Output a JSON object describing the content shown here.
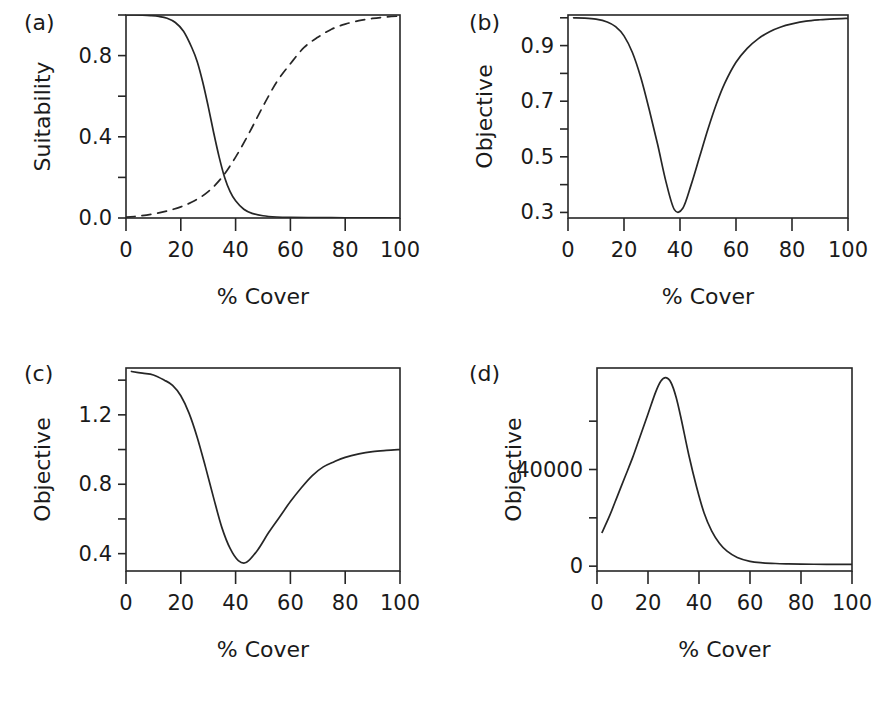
{
  "figure": {
    "width": 891,
    "height": 703,
    "background": "#ffffff",
    "ink_color": "#262626"
  },
  "chart_data": [
    {
      "type": "line",
      "panel_label": "(a)",
      "title": "",
      "xlabel": "% Cover",
      "ylabel": "Suitability",
      "xlim": [
        0,
        100
      ],
      "ylim": [
        0.0,
        1.0
      ],
      "xticks": [
        0,
        20,
        40,
        60,
        80,
        100
      ],
      "xticklabels": [
        "0",
        "20",
        "40",
        "60",
        "80",
        "100"
      ],
      "yticks": [
        0.0,
        0.2,
        0.4,
        0.6,
        0.8,
        1.0
      ],
      "yticklabels": [
        "0.0",
        "",
        "0.4",
        "",
        "0.8",
        ""
      ],
      "grid": false,
      "legend": "none",
      "series": [
        {
          "name": "declining suitability",
          "style": "solid",
          "x": [
            0,
            3,
            6,
            9,
            12,
            15,
            18,
            21,
            24,
            26,
            28,
            30,
            32,
            34,
            36,
            38,
            40,
            43,
            46,
            50,
            55,
            60,
            70,
            80,
            90,
            100
          ],
          "values": [
            1.0,
            1.0,
            0.999,
            0.997,
            0.993,
            0.984,
            0.963,
            0.92,
            0.84,
            0.77,
            0.67,
            0.55,
            0.42,
            0.3,
            0.2,
            0.13,
            0.085,
            0.043,
            0.023,
            0.011,
            0.005,
            0.003,
            0.002,
            0.001,
            0.001,
            0.0
          ]
        },
        {
          "name": "increasing suitability",
          "style": "dashed",
          "x": [
            0,
            5,
            10,
            15,
            20,
            25,
            30,
            35,
            40,
            45,
            50,
            55,
            60,
            65,
            70,
            75,
            80,
            85,
            90,
            95,
            100
          ],
          "values": [
            0.004,
            0.01,
            0.02,
            0.035,
            0.055,
            0.085,
            0.13,
            0.2,
            0.3,
            0.42,
            0.55,
            0.67,
            0.76,
            0.84,
            0.89,
            0.93,
            0.955,
            0.972,
            0.983,
            0.99,
            0.995
          ]
        }
      ]
    },
    {
      "type": "line",
      "panel_label": "(b)",
      "title": "",
      "xlabel": "% Cover",
      "ylabel": "Objective",
      "xlim": [
        0,
        100
      ],
      "ylim": [
        0.28,
        1.01
      ],
      "xticks": [
        0,
        20,
        40,
        60,
        80,
        100
      ],
      "xticklabels": [
        "0",
        "20",
        "40",
        "60",
        "80",
        "100"
      ],
      "yticks": [
        0.3,
        0.4,
        0.5,
        0.6,
        0.7,
        0.8,
        0.9,
        1.0
      ],
      "yticklabels": [
        "0.3",
        "",
        "0.5",
        "",
        "0.7",
        "",
        "0.9",
        ""
      ],
      "grid": false,
      "legend": "none",
      "series": [
        {
          "name": "objective",
          "style": "solid",
          "x": [
            2,
            6,
            10,
            14,
            17,
            20,
            23,
            26,
            29,
            32,
            35,
            38,
            41,
            44,
            47,
            50,
            53,
            56,
            60,
            64,
            68,
            72,
            76,
            80,
            85,
            90,
            95,
            100
          ],
          "values": [
            1.0,
            0.999,
            0.995,
            0.985,
            0.968,
            0.935,
            0.875,
            0.785,
            0.67,
            0.545,
            0.41,
            0.31,
            0.315,
            0.4,
            0.5,
            0.6,
            0.69,
            0.765,
            0.84,
            0.89,
            0.925,
            0.95,
            0.967,
            0.978,
            0.988,
            0.993,
            0.996,
            0.998
          ]
        }
      ]
    },
    {
      "type": "line",
      "panel_label": "(c)",
      "title": "",
      "xlabel": "% Cover",
      "ylabel": "Objective",
      "xlim": [
        0,
        100
      ],
      "ylim": [
        0.3,
        1.47
      ],
      "xticks": [
        0,
        20,
        40,
        60,
        80,
        100
      ],
      "xticklabels": [
        "0",
        "20",
        "40",
        "60",
        "80",
        "100"
      ],
      "yticks": [
        0.4,
        0.6,
        0.8,
        1.0,
        1.2,
        1.4
      ],
      "yticklabels": [
        "0.4",
        "",
        "0.8",
        "",
        "1.2",
        ""
      ],
      "grid": false,
      "legend": "none",
      "series": [
        {
          "name": "objective",
          "style": "solid",
          "x": [
            2,
            6,
            10,
            14,
            17,
            20,
            23,
            26,
            29,
            32,
            35,
            38,
            41,
            44,
            48,
            52,
            56,
            60,
            64,
            68,
            72,
            76,
            80,
            85,
            90,
            95,
            100
          ],
          "values": [
            1.45,
            1.44,
            1.43,
            1.4,
            1.37,
            1.31,
            1.21,
            1.07,
            0.9,
            0.72,
            0.55,
            0.43,
            0.36,
            0.35,
            0.42,
            0.52,
            0.61,
            0.7,
            0.78,
            0.85,
            0.9,
            0.93,
            0.955,
            0.975,
            0.988,
            0.995,
            1.0
          ]
        }
      ]
    },
    {
      "type": "line",
      "panel_label": "(d)",
      "title": "",
      "xlabel": "% Cover",
      "ylabel": "Objective",
      "xlim": [
        0,
        100
      ],
      "ylim": [
        -2000,
        82000
      ],
      "xticks": [
        0,
        20,
        40,
        60,
        80,
        100
      ],
      "xticklabels": [
        "0",
        "20",
        "40",
        "60",
        "80",
        "100"
      ],
      "yticks": [
        0,
        20000,
        40000,
        60000
      ],
      "yticklabels": [
        "0",
        "",
        "40000",
        ""
      ],
      "grid": false,
      "legend": "none",
      "series": [
        {
          "name": "objective",
          "style": "solid",
          "x": [
            2,
            5,
            8,
            11,
            14,
            17,
            20,
            23,
            25,
            27,
            29,
            31,
            33,
            36,
            39,
            42,
            45,
            48,
            51,
            55,
            60,
            65,
            70,
            75,
            80,
            85,
            90,
            95,
            100
          ],
          "values": [
            14000,
            21000,
            29000,
            37000,
            45000,
            54000,
            63000,
            72000,
            76500,
            78000,
            76000,
            70000,
            61000,
            46000,
            33000,
            22000,
            14500,
            9500,
            6200,
            3600,
            2000,
            1400,
            1100,
            950,
            850,
            800,
            780,
            760,
            750
          ]
        }
      ]
    }
  ]
}
